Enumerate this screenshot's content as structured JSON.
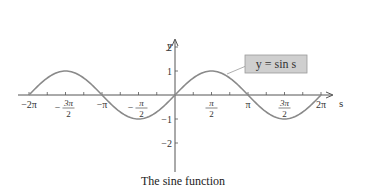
{
  "chart_data": {
    "type": "line",
    "title": "The sine function",
    "xlabel": "s",
    "ylabel": "y",
    "xlim": [
      -6.2832,
      6.2832
    ],
    "ylim": [
      -2.5,
      2.5
    ],
    "grid": false,
    "legend": null,
    "annotation": "y = sin s",
    "x_ticks": [
      {
        "value": -6.2832,
        "label": "−2π"
      },
      {
        "value": -4.7124,
        "label": "−3π/2"
      },
      {
        "value": -3.1416,
        "label": "−π"
      },
      {
        "value": -1.5708,
        "label": "−π/2"
      },
      {
        "value": 1.5708,
        "label": "π/2"
      },
      {
        "value": 3.1416,
        "label": "π"
      },
      {
        "value": 4.7124,
        "label": "3π/2"
      },
      {
        "value": 6.2832,
        "label": "2π"
      }
    ],
    "y_ticks": [
      {
        "value": 2,
        "label": "2"
      },
      {
        "value": 1,
        "label": "1"
      },
      {
        "value": -1,
        "label": "−1"
      },
      {
        "value": -2,
        "label": "−2"
      }
    ],
    "series": [
      {
        "name": "y = sin s",
        "x": [
          -6.2832,
          -4.7124,
          -3.1416,
          -1.5708,
          0,
          1.5708,
          3.1416,
          4.7124,
          6.2832
        ],
        "values": [
          0,
          1,
          0,
          -1,
          0,
          1,
          0,
          -1,
          0
        ],
        "color": "#8a8a8a"
      }
    ]
  },
  "caption": "The sine function",
  "labels": {
    "x_axis": "s",
    "y_axis": "y",
    "curve_label": "y = sin s"
  },
  "colors": {
    "axis": "#555555",
    "curve": "#8a8a8a",
    "label_box_fill": "#cfcfcf",
    "label_box_stroke": "#999999"
  }
}
